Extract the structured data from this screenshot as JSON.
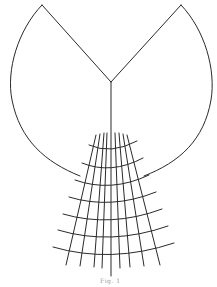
{
  "figure": {
    "caption": "Fig. 1",
    "stroke_color": "#2a2a2a",
    "background": "#ffffff",
    "outline": {
      "left_apex": [
        42,
        5
      ],
      "right_apex": [
        181,
        5
      ],
      "v_vertex": [
        111,
        82
      ],
      "stem_end": [
        111,
        276
      ]
    },
    "grid": {
      "meridian_count": 9,
      "parallel_count": 7
    }
  }
}
